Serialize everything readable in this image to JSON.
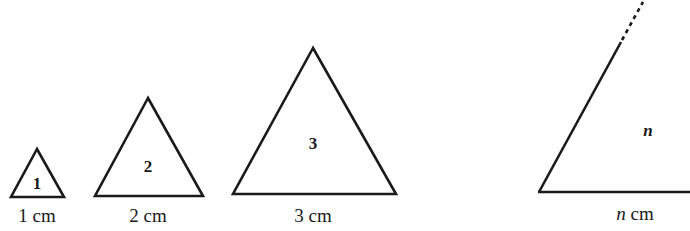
{
  "diagram": {
    "stroke_color": "#1a1a1a",
    "triangles": [
      {
        "index_label": "1",
        "side_label": "1 cm"
      },
      {
        "index_label": "2",
        "side_label": "2 cm"
      },
      {
        "index_label": "3",
        "side_label": "3 cm"
      },
      {
        "index_label": "n",
        "side_label": "n cm",
        "partial": true
      }
    ]
  }
}
